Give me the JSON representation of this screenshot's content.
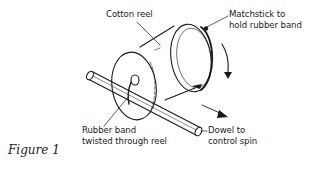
{
  "figure": {
    "caption": "Figure 1"
  },
  "labels": {
    "cotton_reel": [
      "Cotton reel"
    ],
    "matchstick": [
      "Matchstick to",
      "hold rubber band"
    ],
    "rubber_band": [
      "Rubber band",
      "twisted through reel"
    ],
    "dowel": [
      "Dowel to",
      "control spin"
    ]
  },
  "arrows": {
    "rotation": "downward-curved",
    "motion": "down-right"
  },
  "colors": {
    "ink": "#1a1a1a",
    "background": "#ffffff"
  }
}
